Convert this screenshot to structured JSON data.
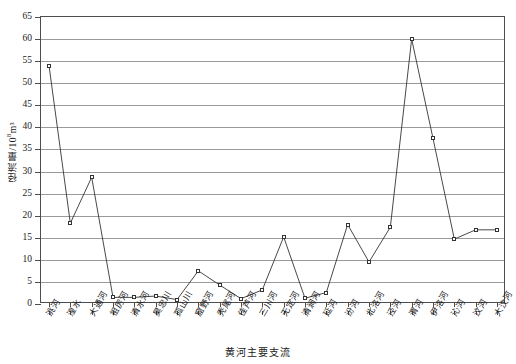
{
  "chart_data": {
    "type": "line",
    "title": "",
    "xlabel": "黄河主要支流",
    "ylabel": "径流量/10⁸m³",
    "ylabel_main": "径流量/10",
    "ylabel_exp": "8",
    "ylabel_tail": "m³",
    "ylim": [
      0,
      65
    ],
    "ytick_step": 5,
    "yticks": [
      0,
      5,
      10,
      15,
      20,
      25,
      30,
      35,
      40,
      45,
      50,
      55,
      60,
      65
    ],
    "grid": true,
    "grid_axis": "y",
    "legend": "none",
    "marker": "open-square",
    "line_color": "#333333",
    "marker_fill": "#ffffff",
    "marker_edge": "#333333",
    "grid_color": "#9a9a9a",
    "axis_color": "#4d4d4d",
    "categories": [
      "洮河",
      "湟水",
      "大通河",
      "祖厉河",
      "清水河",
      "昊忠川",
      "孤山川",
      "窟野河",
      "秃尾河",
      "佳芦河",
      "三川河",
      "无定河",
      "清涧河",
      "延河",
      "汾河",
      "北洛河",
      "泾河",
      "渭河",
      "伊洛河",
      "沁河",
      "汶河",
      "大汶河"
    ],
    "values": [
      54.0,
      18.3,
      28.7,
      1.5,
      1.5,
      1.8,
      1.0,
      7.5,
      4.3,
      1.2,
      3.2,
      15.2,
      1.3,
      2.6,
      18.0,
      9.5,
      17.4,
      60.0,
      37.5,
      14.7,
      16.8,
      16.8
    ],
    "n_points": 22
  }
}
